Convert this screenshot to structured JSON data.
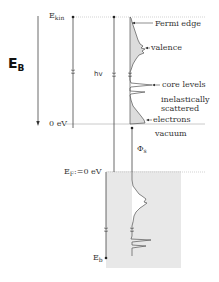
{
  "diagram": {
    "axis_label": {
      "main": "E",
      "sub": "B"
    },
    "upper_axis": {
      "top_label": {
        "main": "E",
        "sub": "kin"
      },
      "bottom_label": "0 eV"
    },
    "photon_label": "hv",
    "upper_spectrum_labels": {
      "fermi_edge": "Fermi edge",
      "valence": "valence",
      "core_levels": "core levels",
      "inelastic_line1": "inelastically",
      "inelastic_line2": "scattered",
      "inelastic_line3": "electrons"
    },
    "vacuum_label": "vacuum",
    "work_function_label": {
      "main": "Φ",
      "sub": "s"
    },
    "lower_axis": {
      "top_label": {
        "main": "E",
        "sub": "F",
        "suffix": ":=0 eV"
      },
      "bottom_label": {
        "main": "E",
        "sub": "b"
      }
    },
    "colors": {
      "line": "#444444",
      "fill": "#e6e6e6",
      "dotted": "#bbbbbb"
    }
  }
}
